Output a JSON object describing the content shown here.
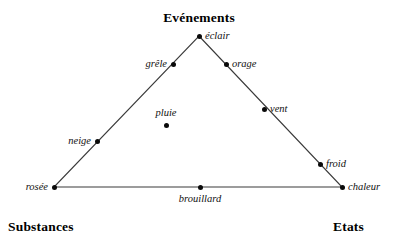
{
  "diagram": {
    "background_color": "#ffffff",
    "line_color": "#3a3a3a",
    "dot_color": "#0a0a0a",
    "headings": {
      "top": "Evénements",
      "bottom_left": "Substances",
      "bottom_right": "Etats"
    },
    "triangle": {
      "apex": {
        "x": 199,
        "y": 36
      },
      "bottom_left": {
        "x": 54,
        "y": 187
      },
      "bottom_right": {
        "x": 342,
        "y": 187
      }
    },
    "nodes": [
      {
        "id": "eclair",
        "label": "éclair",
        "x": 199,
        "y": 36,
        "label_pos": "right"
      },
      {
        "id": "grele",
        "label": "grêle",
        "x": 173,
        "y": 64,
        "label_pos": "left"
      },
      {
        "id": "orage",
        "label": "orage",
        "x": 226,
        "y": 64,
        "label_pos": "right"
      },
      {
        "id": "vent",
        "label": "vent",
        "x": 264,
        "y": 109,
        "label_pos": "right"
      },
      {
        "id": "pluie",
        "label": "pluie",
        "x": 166,
        "y": 125,
        "label_pos": "above"
      },
      {
        "id": "neige",
        "label": "neige",
        "x": 97,
        "y": 141,
        "label_pos": "left"
      },
      {
        "id": "froid",
        "label": "froid",
        "x": 320,
        "y": 164,
        "label_pos": "right"
      },
      {
        "id": "rosee",
        "label": "rosée",
        "x": 54,
        "y": 187,
        "label_pos": "left"
      },
      {
        "id": "brouillard",
        "label": "brouillard",
        "x": 200,
        "y": 187,
        "label_pos": "below"
      },
      {
        "id": "chaleur",
        "label": "chaleur",
        "x": 342,
        "y": 187,
        "label_pos": "right"
      }
    ]
  }
}
